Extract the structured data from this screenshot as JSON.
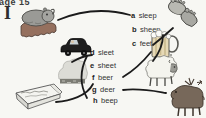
{
  "page": {
    "header": "age 15",
    "exercise_label": "I"
  },
  "word_list": [
    {
      "letter": "a",
      "word": "sleep"
    },
    {
      "letter": "b",
      "word": "sheep"
    },
    {
      "letter": "c",
      "word": "feet"
    },
    {
      "letter": "d",
      "word": "sleet"
    },
    {
      "letter": "e",
      "word": "sheet"
    },
    {
      "letter": "f",
      "word": "beer"
    },
    {
      "letter": "g",
      "word": "deer"
    },
    {
      "letter": "h",
      "word": "beep"
    }
  ],
  "pictures": [
    {
      "name": "hippo-sleeping-in-bed",
      "depicts": "sleep"
    },
    {
      "name": "car-horn",
      "depicts": "beep"
    },
    {
      "name": "sleet-cloud",
      "depicts": "sleet"
    },
    {
      "name": "bed-with-sheet",
      "depicts": "sheet"
    },
    {
      "name": "pair-of-feet",
      "depicts": "feet"
    },
    {
      "name": "beer-mug",
      "depicts": "beer"
    },
    {
      "name": "sheep",
      "depicts": "sheep"
    },
    {
      "name": "deer",
      "depicts": "deer"
    }
  ],
  "matches": [
    {
      "word": "sleep",
      "picture": "hippo-sleeping-in-bed"
    },
    {
      "word": "sheep",
      "picture": "sheep"
    },
    {
      "word": "feet",
      "picture": "pair-of-feet"
    },
    {
      "word": "sleet",
      "picture": "sleet-cloud"
    },
    {
      "word": "sheet",
      "picture": "bed-with-sheet"
    },
    {
      "word": "beer",
      "picture": "beer-mug"
    },
    {
      "word": "deer",
      "picture": "deer"
    },
    {
      "word": "beep",
      "picture": "car-horn"
    }
  ],
  "colors": {
    "paper": "#f7f7f3",
    "ink": "#1b1b1b",
    "hippo_gray": "#9a9a96",
    "cart_brown": "#95705e",
    "cloud_gray": "#dcdcd6",
    "deer_brown": "#77685a",
    "beer_tan": "#e6d9b6"
  }
}
